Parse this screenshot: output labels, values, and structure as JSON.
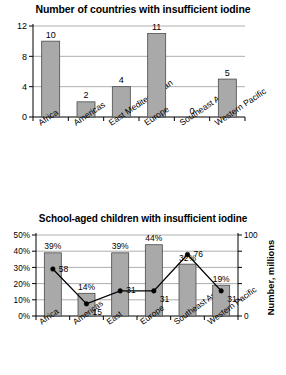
{
  "chart_data": [
    {
      "type": "bar",
      "id": "countries-insufficient-iodine",
      "title": "Number of countries with insufficient iodine",
      "xlabel": "",
      "ylabel": "",
      "ylim": [
        0,
        12
      ],
      "yticks": [
        0,
        4,
        8,
        12
      ],
      "ytick_labels": [
        "0",
        "4",
        "8",
        "12"
      ],
      "grid": true,
      "categories": [
        "Africa",
        "Americas",
        "East Mediterranean",
        "Europe",
        "Southeast Asia",
        "Western Pacific"
      ],
      "values": [
        10,
        2,
        4,
        11,
        0,
        5
      ],
      "value_labels": [
        "10",
        "2",
        "4",
        "11",
        "0",
        "5"
      ],
      "bar_color": "#a9a9a9",
      "bar_edge_color": "#4a4a4a"
    },
    {
      "type": "bar",
      "id": "school-aged-children-insufficient-iodine",
      "title": "School-aged children with insufficient iodine",
      "xlabel": "",
      "ylabel": "",
      "ylim": [
        0,
        50
      ],
      "yticks": [
        0,
        10,
        20,
        30,
        40,
        50
      ],
      "ytick_labels": [
        "0%",
        "10%",
        "20%",
        "30%",
        "40%",
        "50%"
      ],
      "y2lim": [
        0,
        100
      ],
      "y2ticks": [
        0,
        100
      ],
      "y2tick_labels": [
        "0",
        "100"
      ],
      "y2label": "Number, millions",
      "grid": true,
      "categories": [
        "Africa",
        "Americas",
        "East",
        "Europe",
        "Southeast Asia",
        "Western Pacific"
      ],
      "series": [
        {
          "name": "percent",
          "kind": "bar",
          "values": [
            39,
            14,
            39,
            44,
            32,
            19
          ],
          "value_labels": [
            "39%",
            "14%",
            "39%",
            "44%",
            "32%",
            "19%"
          ]
        },
        {
          "name": "millions",
          "kind": "line",
          "values": [
            58,
            15,
            31,
            31,
            76,
            31
          ],
          "value_labels": [
            "58",
            "15",
            "31",
            "31",
            "76",
            "31"
          ]
        }
      ],
      "bar_color": "#a9a9a9",
      "bar_edge_color": "#4a4a4a",
      "line_color": "#000000"
    }
  ]
}
